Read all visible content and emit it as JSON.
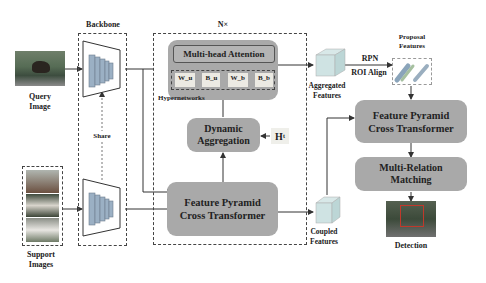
{
  "diagram": {
    "repeat_label": "N×",
    "backbone_label": "Backbone",
    "share_label": "Share",
    "query": {
      "label_line1": "Query",
      "label_line2": "Image"
    },
    "support": {
      "label_line1": "Support",
      "label_line2": "Images"
    },
    "attention": {
      "label": "Multi-head Attention"
    },
    "hypernetworks": {
      "label": "Hypernetworks",
      "params": [
        "W_u",
        "B_u",
        "W_b",
        "B_b"
      ]
    },
    "dynamic_aggregation": {
      "line1": "Dynamic",
      "line2": "Aggregation"
    },
    "ht_label": "H",
    "ht_sub": "t",
    "fpct_left": {
      "line1": "Feature Pyramid",
      "line2": "Cross Transformer"
    },
    "aggregated": {
      "line1": "Aggregated",
      "line2": "Features"
    },
    "coupled": {
      "line1": "Coupled",
      "line2": "Features"
    },
    "rpn_label": "RPN",
    "roi_label": "ROI Align",
    "proposal": {
      "line1": "Proposal",
      "line2": "Features"
    },
    "fpct_right": {
      "line1": "Feature Pyramid",
      "line2": "Cross Transformer"
    },
    "mrm": {
      "line1": "Multi-Relation",
      "line2": "Matching"
    },
    "detection_label": "Detection"
  },
  "colors": {
    "box_fill": "#a9a9a9",
    "inner_fill": "#c4c4c4",
    "stroke": "#444444"
  }
}
